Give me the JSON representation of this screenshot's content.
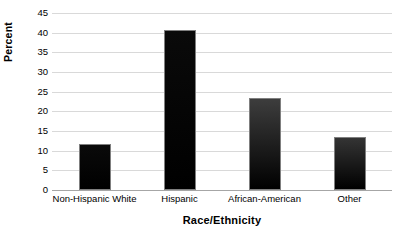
{
  "chart_data": {
    "type": "bar",
    "title": "",
    "subtitle": "",
    "xlabel": "Race/Ethnicity",
    "ylabel": "Percent",
    "categories": [
      "Non-Hispanic White",
      "Hispanic",
      "African-American",
      "Other"
    ],
    "values": [
      11.7,
      40.7,
      23.4,
      13.6
    ],
    "series": [
      {
        "name": "Percent",
        "values": [
          11.7,
          40.7,
          23.4,
          13.6
        ]
      }
    ],
    "ylim": [
      0,
      45
    ],
    "y_ticks": [
      0,
      5,
      10,
      15,
      20,
      25,
      30,
      35,
      40,
      45
    ],
    "y_tick_labels": [
      "0",
      "5",
      "10",
      "15",
      "20",
      "25",
      "30",
      "35",
      "40",
      "45"
    ],
    "grid": true,
    "grid_axis": "y",
    "legend": false,
    "legend_position": "none",
    "annotations": [],
    "bar_styles": [
      {
        "top_color": "#0a0a0a",
        "bottom_color": "#000000"
      },
      {
        "top_color": "#0a0a0a",
        "bottom_color": "#000000"
      },
      {
        "top_color": "#3d3d3d",
        "bottom_color": "#000000"
      },
      {
        "top_color": "#343434",
        "bottom_color": "#000000"
      }
    ]
  },
  "colors": {
    "background": "#ffffff",
    "gridline": "#d9d9d9",
    "axis_line": "#8c8c8c",
    "zero_line": "#a6a6a6",
    "bar_border": "#7f7f7f",
    "text": "#000000"
  }
}
